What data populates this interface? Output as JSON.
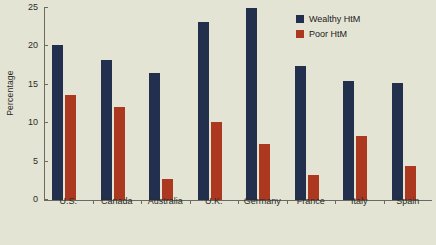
{
  "chart_data": {
    "type": "bar",
    "title": "",
    "xlabel": "",
    "ylabel": "Percentage",
    "ylim": [
      0,
      25
    ],
    "yticks": [
      0,
      5,
      10,
      15,
      20,
      25
    ],
    "grid": false,
    "legend_position": "top-right",
    "categories": [
      "U.S.",
      "Canada",
      "Australia",
      "U.K.",
      "Germany",
      "France",
      "Italy",
      "Spain"
    ],
    "series": [
      {
        "name": "Wealthy HtM",
        "color": "#22304e",
        "values": [
          20.2,
          18.2,
          16.5,
          23.2,
          25.0,
          17.4,
          15.5,
          15.2
        ]
      },
      {
        "name": "Poor HtM",
        "color": "#ad3820",
        "values": [
          13.7,
          12.1,
          2.7,
          10.2,
          7.3,
          3.2,
          8.3,
          4.4
        ]
      }
    ]
  },
  "colors": {
    "background": "#e4e4d4",
    "axis": "#6a6a60",
    "text": "#2b2b26"
  }
}
